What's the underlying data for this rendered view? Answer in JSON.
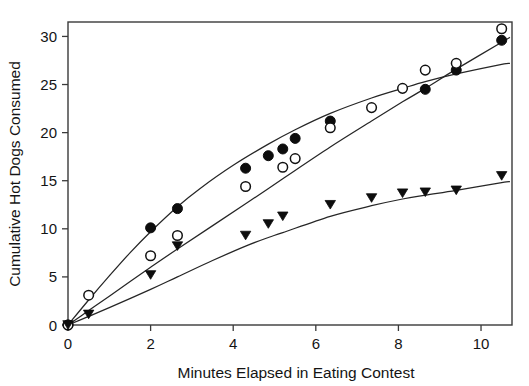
{
  "chart_data": {
    "type": "scatter",
    "title": "",
    "xlabel": "Minutes Elapsed in Eating Contest",
    "ylabel": "Cumulative Hot Dogs Consumed",
    "xlim": [
      0,
      10.75
    ],
    "ylim": [
      0,
      31.5
    ],
    "xticks": [
      0,
      2,
      4,
      6,
      8,
      10
    ],
    "xticklabels": [
      "0",
      "2",
      "4",
      "6",
      "8",
      "10"
    ],
    "yticks": [
      0,
      5,
      10,
      15,
      20,
      25,
      30
    ],
    "yticklabels": [
      "0",
      "5",
      "10",
      "15",
      "20",
      "25",
      "30"
    ],
    "grid": false,
    "legend": "none",
    "frame": "box",
    "series": [
      {
        "name": "filled-circles",
        "marker": "filled-circle",
        "color": "#0d0d0d",
        "fit": "curve",
        "points": [
          {
            "x": 0.0,
            "y": 0.0
          },
          {
            "x": 2.0,
            "y": 10.1
          },
          {
            "x": 2.65,
            "y": 12.1
          },
          {
            "x": 4.3,
            "y": 16.3
          },
          {
            "x": 4.85,
            "y": 17.6
          },
          {
            "x": 5.2,
            "y": 18.3
          },
          {
            "x": 5.5,
            "y": 19.4
          },
          {
            "x": 6.35,
            "y": 21.2
          },
          {
            "x": 8.65,
            "y": 24.5
          },
          {
            "x": 9.4,
            "y": 26.5
          },
          {
            "x": 10.5,
            "y": 29.6
          }
        ]
      },
      {
        "name": "open-circles",
        "marker": "open-circle",
        "color": "#111111",
        "fit": "curve",
        "points": [
          {
            "x": 0.0,
            "y": 0.0
          },
          {
            "x": 0.5,
            "y": 3.1
          },
          {
            "x": 2.0,
            "y": 7.2
          },
          {
            "x": 2.65,
            "y": 9.3
          },
          {
            "x": 4.3,
            "y": 14.4
          },
          {
            "x": 5.2,
            "y": 16.4
          },
          {
            "x": 5.5,
            "y": 17.3
          },
          {
            "x": 6.35,
            "y": 20.5
          },
          {
            "x": 7.35,
            "y": 22.6
          },
          {
            "x": 8.1,
            "y": 24.6
          },
          {
            "x": 8.65,
            "y": 26.5
          },
          {
            "x": 9.4,
            "y": 27.2
          },
          {
            "x": 10.5,
            "y": 30.8
          }
        ]
      },
      {
        "name": "filled-triangles",
        "marker": "filled-triangle-down",
        "color": "#0d0d0d",
        "fit": "curve",
        "points": [
          {
            "x": 0.0,
            "y": 0.0
          },
          {
            "x": 0.5,
            "y": 1.1
          },
          {
            "x": 2.0,
            "y": 5.2
          },
          {
            "x": 2.65,
            "y": 8.2
          },
          {
            "x": 4.3,
            "y": 9.3
          },
          {
            "x": 4.85,
            "y": 10.5
          },
          {
            "x": 5.2,
            "y": 11.3
          },
          {
            "x": 6.35,
            "y": 12.5
          },
          {
            "x": 7.35,
            "y": 13.2
          },
          {
            "x": 8.1,
            "y": 13.7
          },
          {
            "x": 8.65,
            "y": 13.8
          },
          {
            "x": 9.4,
            "y": 14.0
          },
          {
            "x": 10.5,
            "y": 15.5
          }
        ]
      }
    ],
    "fit_curves": [
      {
        "name": "filled-circles-fit",
        "x": [
          0,
          0.5,
          1,
          1.5,
          2,
          2.65,
          3.2,
          4,
          4.85,
          5.5,
          6.35,
          7.35,
          8.1,
          8.65,
          9.4,
          10.5,
          10.7
        ],
        "y": [
          0,
          2.6,
          5.1,
          7.5,
          9.7,
          12.3,
          14.2,
          16.6,
          18.8,
          20.3,
          22.0,
          23.6,
          24.6,
          25.3,
          26.1,
          27.1,
          27.2
        ]
      },
      {
        "name": "open-circles-fit",
        "x": [
          0,
          0.5,
          1,
          2,
          2.65,
          4.3,
          5.2,
          6.35,
          7.35,
          8.1,
          8.65,
          9.4,
          10.5,
          10.7
        ],
        "y": [
          0,
          1.5,
          3.0,
          6.0,
          7.9,
          12.6,
          15.2,
          18.5,
          21.2,
          23.2,
          24.6,
          26.6,
          29.4,
          29.9
        ]
      },
      {
        "name": "filled-triangles-fit",
        "x": [
          0,
          0.5,
          1,
          2,
          2.65,
          3.5,
          4.3,
          4.85,
          5.2,
          6.35,
          7.35,
          8.1,
          8.65,
          9.4,
          10.5,
          10.7
        ],
        "y": [
          0,
          0.9,
          1.8,
          3.7,
          5.0,
          6.7,
          8.2,
          9.1,
          9.6,
          11.3,
          12.4,
          13.1,
          13.5,
          14.0,
          14.8,
          14.9
        ]
      }
    ]
  }
}
